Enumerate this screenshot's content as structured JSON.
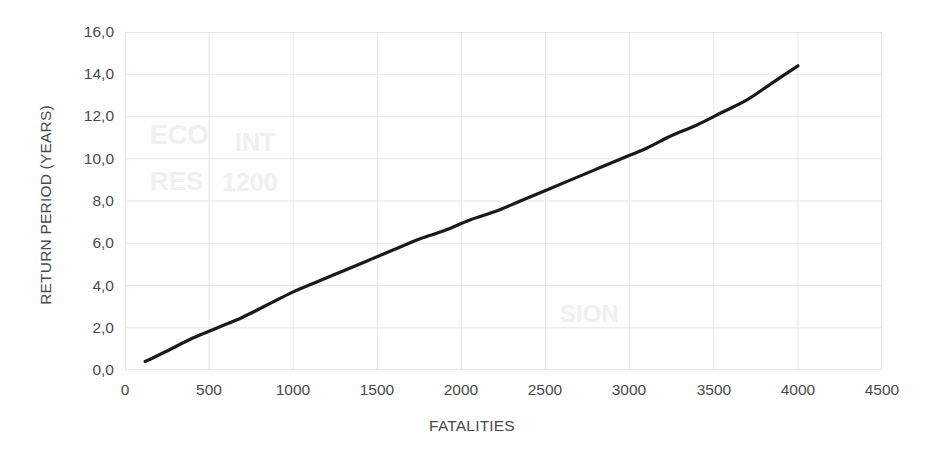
{
  "chart_data": {
    "type": "line",
    "title": "",
    "subtitle": "",
    "xlabel": "FATALITIES",
    "ylabel": "RETURN PERIOD (YEARS)",
    "xlim": [
      0,
      4500
    ],
    "ylim": [
      0.0,
      16.0
    ],
    "xticks": [
      0,
      500,
      1000,
      1500,
      2000,
      2500,
      3000,
      3500,
      4000,
      4500
    ],
    "xtick_labels": [
      "0",
      "500",
      "1000",
      "1500",
      "2000",
      "2500",
      "3000",
      "3500",
      "4000",
      "4500"
    ],
    "yticks": [
      0.0,
      2.0,
      4.0,
      6.0,
      8.0,
      10.0,
      12.0,
      14.0,
      16.0
    ],
    "ytick_labels": [
      "0,0",
      "2,0",
      "4,0",
      "6,0",
      "8,0",
      "10,0",
      "12,0",
      "14,0",
      "16,0"
    ],
    "decimal_separator": ",",
    "grid": true,
    "grid_color": "#e8e8e8",
    "legend": false,
    "legend_position": "none",
    "series": [
      {
        "name": "Return period",
        "color": "#1a1a1a",
        "line_width": 3.2,
        "markers": false,
        "x": [
          120,
          250,
          400,
          550,
          700,
          850,
          1000,
          1150,
          1300,
          1450,
          1600,
          1750,
          1900,
          2050,
          2200,
          2350,
          2500,
          2650,
          2800,
          2950,
          3100,
          3250,
          3400,
          3550,
          3700,
          3850,
          4000
        ],
        "y": [
          0.4,
          0.9,
          1.5,
          2.0,
          2.5,
          3.1,
          3.7,
          4.2,
          4.7,
          5.2,
          5.7,
          6.2,
          6.6,
          7.1,
          7.5,
          8.0,
          8.5,
          9.0,
          9.5,
          10.0,
          10.5,
          11.1,
          11.6,
          12.2,
          12.8,
          13.6,
          14.4
        ]
      }
    ],
    "reference_points": [
      {
        "x": 120,
        "y": 0.4
      },
      {
        "x": 500,
        "y": 1.8
      },
      {
        "x": 1000,
        "y": 3.7
      },
      {
        "x": 1500,
        "y": 5.4
      },
      {
        "x": 2000,
        "y": 6.9
      },
      {
        "x": 2500,
        "y": 8.5
      },
      {
        "x": 3000,
        "y": 10.2
      },
      {
        "x": 3500,
        "y": 12.0
      },
      {
        "x": 4000,
        "y": 14.4
      }
    ]
  },
  "artifacts": {
    "note": "faint scanner bleed-through marks visible in background",
    "marks": [
      "ECO",
      "INT",
      "RES",
      "1200",
      "SION"
    ]
  }
}
